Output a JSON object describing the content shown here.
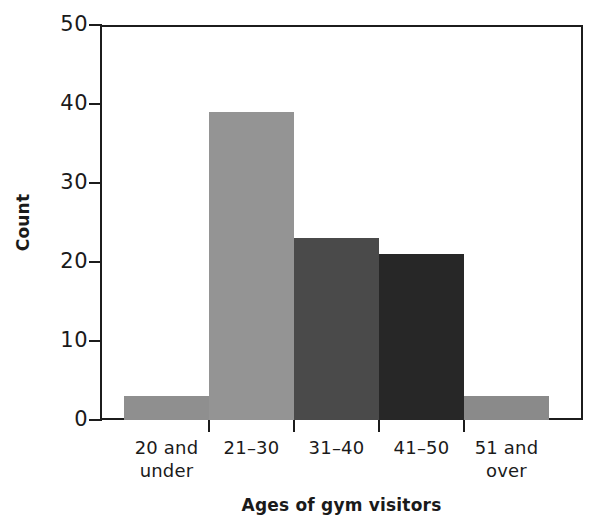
{
  "chart_data": {
    "type": "bar",
    "title": "",
    "xlabel": "Ages of gym visitors",
    "ylabel": "Count",
    "categories": [
      "20 and under",
      "21–30",
      "31–40",
      "41–50",
      "51 and over"
    ],
    "category_lines": [
      [
        "20 and",
        "under"
      ],
      [
        "21–30",
        ""
      ],
      [
        "31–40",
        ""
      ],
      [
        "41–50",
        ""
      ],
      [
        "51 and",
        "over"
      ]
    ],
    "values": [
      3,
      39,
      23,
      21,
      3
    ],
    "bar_colors": [
      "#8f8f8f",
      "#949494",
      "#4a4a4a",
      "#272727",
      "#8a8a8a"
    ],
    "ylim": [
      0,
      50
    ],
    "yticks": [
      0,
      10,
      20,
      30,
      40,
      50
    ],
    "ytick_labels": [
      "0",
      "10",
      "20",
      "30",
      "40",
      "50"
    ],
    "grid": false,
    "legend": false,
    "axis_color": "#1c1c1c"
  },
  "axes": {
    "y_title": "Count",
    "x_title": "Ages of gym visitors"
  }
}
